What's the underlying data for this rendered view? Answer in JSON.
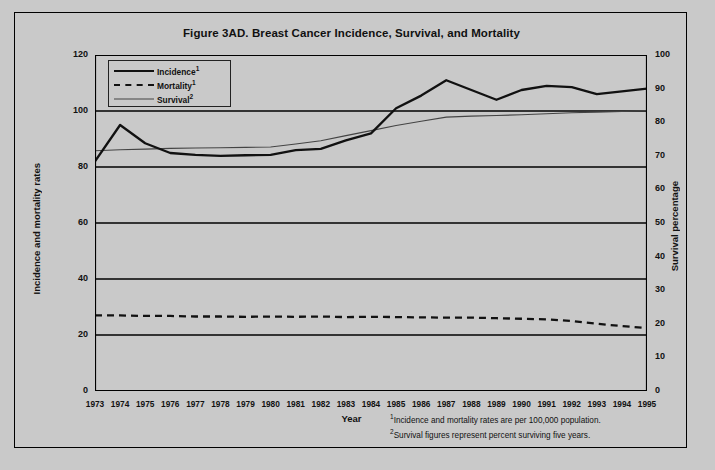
{
  "figure": {
    "title": "Figure 3AD. Breast Cancer Incidence, Survival, and Mortality",
    "x_axis_title": "Year",
    "y_left_title": "Incidence and mortality rates",
    "y_right_title": "Survival percentage",
    "footnote_1": "Incidence and mortality rates are per 100,000 population.",
    "footnote_2": "Survival figures represent percent surviving five years.",
    "footnote_1_marker": "1",
    "footnote_2_marker": "2"
  },
  "legend": {
    "position": "top-left-inside",
    "items": [
      {
        "label": "Incidence",
        "marker": "1",
        "style": "thick-solid",
        "color": "#111111"
      },
      {
        "label": "Mortality",
        "marker": "1",
        "style": "dashed",
        "color": "#111111"
      },
      {
        "label": "Survival",
        "marker": "2",
        "style": "thin-solid",
        "color": "#444444"
      }
    ]
  },
  "chart_data": {
    "type": "line",
    "title": "Figure 3AD. Breast Cancer Incidence, Survival, and Mortality",
    "xlabel": "Year",
    "ylabel": "Incidence and mortality rates",
    "y2label": "Survival percentage",
    "grid": true,
    "legend_position": "upper left",
    "x": [
      1973,
      1974,
      1975,
      1976,
      1977,
      1978,
      1979,
      1980,
      1981,
      1982,
      1983,
      1984,
      1985,
      1986,
      1987,
      1988,
      1989,
      1990,
      1991,
      1992,
      1993,
      1994,
      1995
    ],
    "xticklabels": [
      "1973",
      "1974",
      "1975",
      "1976",
      "1977",
      "1978",
      "1979",
      "1980",
      "1981",
      "1982",
      "1983",
      "1984",
      "1985",
      "1986",
      "1987",
      "1988",
      "1989",
      "1990",
      "1991",
      "1992",
      "1993",
      "1994",
      "1995"
    ],
    "ylim": [
      0,
      120
    ],
    "yticks": [
      0,
      20,
      40,
      60,
      80,
      100,
      120
    ],
    "y2lim": [
      0,
      100
    ],
    "y2ticks": [
      0,
      10,
      20,
      30,
      40,
      50,
      60,
      70,
      80,
      90,
      100
    ],
    "series": [
      {
        "name": "Incidence",
        "axis": "left",
        "style": "thick-solid",
        "color": "#111111",
        "units": "per 100,000 population",
        "values": [
          82.0,
          95.0,
          88.5,
          85.0,
          84.3,
          84.0,
          84.2,
          84.3,
          86.0,
          86.5,
          89.5,
          92.0,
          101.0,
          105.5,
          111.0,
          107.5,
          104.0,
          107.5,
          109.0,
          108.5,
          106.0,
          107.0,
          108.0
        ]
      },
      {
        "name": "Mortality",
        "axis": "left",
        "style": "dashed",
        "color": "#111111",
        "units": "per 100,000 population",
        "values": [
          27.0,
          27.0,
          26.8,
          26.8,
          26.6,
          26.6,
          26.5,
          26.6,
          26.5,
          26.6,
          26.4,
          26.5,
          26.4,
          26.3,
          26.2,
          26.2,
          26.0,
          25.8,
          25.6,
          25.0,
          24.0,
          23.2,
          22.5
        ]
      },
      {
        "name": "Survival",
        "axis": "right",
        "style": "thin-solid",
        "color": "#444444",
        "units": "percent surviving five years",
        "values": [
          71.5,
          71.8,
          72.0,
          72.2,
          72.3,
          72.4,
          72.5,
          72.6,
          73.5,
          74.5,
          76.0,
          77.5,
          79.0,
          80.3,
          81.5,
          81.8,
          82.0,
          82.2,
          82.5,
          82.8,
          83.0,
          83.2,
          83.5
        ]
      }
    ]
  }
}
